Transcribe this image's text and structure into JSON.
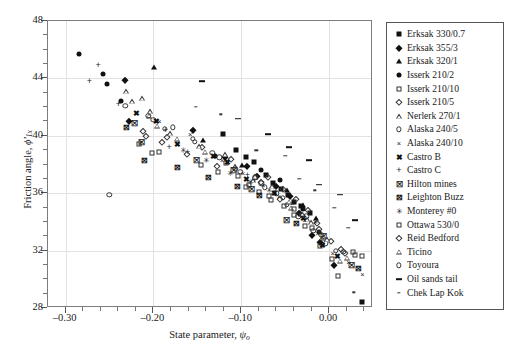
{
  "figure": {
    "title": "",
    "y_axis_label_prefix": "Friction angle, ",
    "y_axis_label_symbol": "ϕ'",
    "y_axis_label_sub": "1x",
    "x_axis_label_prefix": "State parameter, ",
    "x_axis_label_symbol": "ψ",
    "x_axis_label_sub": "o"
  },
  "chart_data": {
    "type": "scatter",
    "title": "",
    "xlabel": "State parameter, ψo",
    "ylabel": "Friction angle, ϕ'1x",
    "xlim": [
      -0.32,
      0.05
    ],
    "ylim": [
      28,
      48
    ],
    "xticks": [
      -0.3,
      -0.2,
      -0.1,
      0.0
    ],
    "xtick_labels": [
      "–0.30",
      "–0.20",
      "–0.10",
      "0.00"
    ],
    "xticks_minor": [
      -0.28,
      -0.26,
      -0.24,
      -0.22,
      -0.18,
      -0.16,
      -0.14,
      -0.12,
      -0.08,
      -0.06,
      -0.04,
      -0.02,
      0.02,
      0.04
    ],
    "yticks": [
      28,
      32,
      36,
      40,
      44,
      48
    ],
    "ytick_labels": [
      "28",
      "32",
      "36",
      "40",
      "44",
      "48"
    ],
    "yticks_minor": [
      29,
      30,
      31,
      33,
      34,
      35,
      37,
      38,
      39,
      41,
      42,
      43,
      45,
      46,
      47
    ],
    "grid": true,
    "grid_color": "#e2e2e2",
    "legend_position": "right-outside",
    "series": [
      {
        "name": "Erksak 330/0.7",
        "marker": "square-filled",
        "points": [
          [
            -0.121,
            40.1
          ],
          [
            -0.106,
            39.0
          ],
          [
            -0.095,
            38.5
          ],
          [
            -0.086,
            38.2
          ],
          [
            -0.072,
            37.3
          ],
          [
            -0.064,
            36.7
          ],
          [
            -0.055,
            36.3
          ],
          [
            -0.047,
            35.9
          ],
          [
            -0.04,
            35.4
          ],
          [
            -0.032,
            35.1
          ],
          [
            -0.022,
            34.6
          ],
          [
            0.038,
            28.4
          ]
        ]
      },
      {
        "name": "Erksak 355/3",
        "marker": "diamond-filled",
        "points": [
          [
            -0.232,
            43.9
          ],
          [
            -0.228,
            41.0
          ],
          [
            -0.155,
            40.4
          ],
          [
            -0.118,
            38.5
          ],
          [
            -0.093,
            37.9
          ],
          [
            -0.082,
            37.2
          ],
          [
            -0.06,
            36.5
          ],
          [
            -0.044,
            35.8
          ],
          [
            -0.034,
            34.6
          ],
          [
            -0.02,
            33.1
          ],
          [
            -0.01,
            32.6
          ],
          [
            0.006,
            31.0
          ]
        ]
      },
      {
        "name": "Erksak 320/1",
        "marker": "triangle-filled",
        "points": [
          [
            -0.199,
            44.8
          ],
          [
            -0.144,
            39.7
          ],
          [
            -0.099,
            38.0
          ],
          [
            -0.048,
            36.2
          ],
          [
            -0.03,
            35.2
          ],
          [
            -0.015,
            34.3
          ]
        ]
      },
      {
        "name": "Isserk 210/2",
        "marker": "circle-filled",
        "points": [
          [
            -0.285,
            45.7
          ],
          [
            -0.257,
            44.3
          ],
          [
            -0.253,
            43.6
          ],
          [
            -0.237,
            42.4
          ],
          [
            -0.13,
            38.6
          ],
          [
            -0.078,
            37.6
          ],
          [
            -0.056,
            36.9
          ],
          [
            -0.03,
            34.9
          ],
          [
            -0.011,
            33.3
          ]
        ]
      },
      {
        "name": "Isserk 210/10",
        "marker": "square-open",
        "points": [
          [
            -0.216,
            39.4
          ],
          [
            -0.202,
            38.8
          ],
          [
            -0.117,
            38.1
          ],
          [
            -0.104,
            37.2
          ],
          [
            -0.091,
            36.6
          ],
          [
            -0.08,
            36.1
          ],
          [
            -0.066,
            35.5
          ],
          [
            -0.051,
            35.1
          ],
          [
            -0.04,
            34.5
          ],
          [
            -0.027,
            33.7
          ],
          [
            -0.01,
            32.3
          ],
          [
            0.01,
            30.2
          ],
          [
            0.03,
            31.7
          ],
          [
            0.038,
            31.6
          ]
        ]
      },
      {
        "name": "Isserk 210/5",
        "marker": "diamond-open",
        "points": [
          [
            -0.212,
            40.3
          ],
          [
            -0.185,
            39.9
          ],
          [
            -0.145,
            39.2
          ],
          [
            -0.112,
            38.4
          ],
          [
            -0.07,
            37.1
          ],
          [
            -0.052,
            36.3
          ],
          [
            -0.038,
            35.6
          ],
          [
            -0.024,
            34.8
          ],
          [
            -0.014,
            33.9
          ],
          [
            0.002,
            32.7
          ],
          [
            0.014,
            32.1
          ]
        ]
      },
      {
        "name": "Nerlerk 270/1",
        "marker": "triangle-open",
        "points": [
          [
            -0.231,
            43.1
          ],
          [
            -0.213,
            42.6
          ],
          [
            -0.205,
            41.4
          ],
          [
            -0.196,
            40.7
          ],
          [
            -0.173,
            39.8
          ],
          [
            -0.141,
            38.9
          ],
          [
            -0.107,
            37.9
          ],
          [
            -0.087,
            36.9
          ],
          [
            -0.063,
            36.1
          ],
          [
            -0.043,
            35.0
          ],
          [
            -0.025,
            34.2
          ],
          [
            -0.008,
            32.9
          ],
          [
            0.012,
            31.3
          ]
        ]
      },
      {
        "name": "Alaska 240/5",
        "marker": "circle-open",
        "points": [
          [
            -0.232,
            42.1
          ],
          [
            -0.2,
            41.1
          ],
          [
            -0.187,
            40.5
          ],
          [
            -0.153,
            39.6
          ],
          [
            -0.125,
            38.5
          ],
          [
            -0.101,
            37.5
          ],
          [
            -0.084,
            37.1
          ],
          [
            -0.073,
            36.4
          ],
          [
            -0.06,
            36.0
          ],
          [
            -0.048,
            35.2
          ],
          [
            -0.035,
            34.4
          ],
          [
            -0.018,
            33.4
          ],
          [
            -0.004,
            32.5
          ],
          [
            0.016,
            31.9
          ],
          [
            -0.25,
            35.9
          ]
        ]
      },
      {
        "name": "Alaska 240/10",
        "marker": "x",
        "points": [
          [
            -0.193,
            41.0
          ],
          [
            -0.158,
            40.1
          ],
          [
            -0.122,
            38.3
          ],
          [
            -0.098,
            37.4
          ],
          [
            -0.075,
            36.6
          ],
          [
            -0.057,
            35.8
          ],
          [
            -0.042,
            35.3
          ],
          [
            -0.028,
            34.1
          ],
          [
            -0.013,
            33.2
          ],
          [
            0.004,
            31.8
          ],
          [
            0.022,
            31.2
          ],
          [
            0.038,
            30.4
          ]
        ]
      },
      {
        "name": "Castro B",
        "marker": "x-bold",
        "points": [
          [
            -0.219,
            41.6
          ],
          [
            -0.196,
            41.0
          ],
          [
            -0.173,
            39.4
          ],
          [
            -0.132,
            38.6
          ],
          [
            -0.116,
            38.2
          ],
          [
            -0.094,
            37.0
          ],
          [
            -0.062,
            36.0
          ],
          [
            -0.029,
            34.3
          ],
          [
            -0.007,
            32.4
          ],
          [
            0.01,
            31.6
          ]
        ]
      },
      {
        "name": "Castro C",
        "marker": "plus",
        "points": [
          [
            -0.263,
            44.9
          ],
          [
            -0.273,
            43.8
          ],
          [
            -0.24,
            42.2
          ],
          [
            -0.186,
            40.4
          ],
          [
            -0.182,
            39.2
          ],
          [
            -0.161,
            38.9
          ],
          [
            -0.093,
            37.3
          ],
          [
            -0.085,
            36.9
          ]
        ]
      },
      {
        "name": "Hilton mines",
        "marker": "x-box",
        "points": [
          [
            -0.221,
            40.9
          ],
          [
            -0.214,
            39.6
          ],
          [
            -0.151,
            38.3
          ],
          [
            -0.109,
            37.6
          ],
          [
            -0.088,
            36.3
          ],
          [
            -0.048,
            34.1
          ],
          [
            -0.006,
            33.0
          ],
          [
            0.026,
            31.0
          ]
        ]
      },
      {
        "name": "Leighton Buzz",
        "marker": "square-x",
        "points": [
          [
            -0.231,
            40.6
          ],
          [
            -0.21,
            38.3
          ],
          [
            -0.173,
            37.8
          ],
          [
            -0.137,
            37.1
          ],
          [
            -0.104,
            36.5
          ],
          [
            -0.079,
            35.9
          ],
          [
            -0.037,
            33.9
          ],
          [
            0.034,
            30.8
          ]
        ]
      },
      {
        "name": "Monterey #0",
        "marker": "star",
        "points": [
          [
            -0.166,
            39.0
          ],
          [
            -0.14,
            38.3
          ],
          [
            -0.112,
            37.4
          ],
          [
            -0.09,
            36.8
          ],
          [
            -0.068,
            36.2
          ],
          [
            -0.032,
            34.7
          ],
          [
            -0.016,
            34.0
          ]
        ]
      },
      {
        "name": "Ottawa 530/0",
        "marker": "square-open-sm",
        "points": [
          [
            -0.194,
            38.9
          ],
          [
            -0.146,
            38.0
          ],
          [
            -0.126,
            37.5
          ],
          [
            -0.095,
            36.4
          ],
          [
            -0.068,
            35.8
          ],
          [
            -0.04,
            34.9
          ],
          [
            -0.019,
            33.6
          ],
          [
            0.003,
            31.4
          ],
          [
            0.027,
            31.9
          ]
        ]
      },
      {
        "name": "Reid Bedford",
        "marker": "diamond-open-sm",
        "points": [
          [
            -0.208,
            40.0
          ],
          [
            -0.19,
            39.6
          ],
          [
            -0.162,
            38.7
          ],
          [
            -0.128,
            37.9
          ],
          [
            -0.078,
            36.8
          ],
          [
            -0.056,
            35.6
          ],
          [
            -0.031,
            34.5
          ],
          [
            -0.012,
            33.5
          ],
          [
            0.018,
            31.8
          ]
        ]
      },
      {
        "name": "Ticino",
        "marker": "triangle-open-sm",
        "points": [
          [
            -0.224,
            42.4
          ],
          [
            -0.204,
            41.7
          ],
          [
            -0.181,
            40.2
          ],
          [
            -0.148,
            39.3
          ],
          [
            -0.118,
            38.7
          ],
          [
            -0.084,
            37.2
          ],
          [
            -0.065,
            36.5
          ],
          [
            -0.046,
            35.4
          ],
          [
            -0.021,
            34.0
          ],
          [
            -0.002,
            32.8
          ],
          [
            0.02,
            31.5
          ]
        ]
      },
      {
        "name": "Toyoura",
        "marker": "circle-open-sm",
        "points": [
          [
            -0.206,
            41.4
          ],
          [
            -0.178,
            40.6
          ],
          [
            -0.155,
            39.8
          ],
          [
            -0.133,
            38.8
          ],
          [
            -0.106,
            37.7
          ],
          [
            -0.077,
            36.7
          ],
          [
            -0.053,
            35.7
          ],
          [
            -0.026,
            34.4
          ],
          [
            -0.009,
            33.1
          ],
          [
            0.008,
            32.0
          ]
        ]
      },
      {
        "name": "Oil sands tail",
        "marker": "dash-long",
        "points": [
          [
            -0.145,
            43.8
          ],
          [
            -0.104,
            41.2
          ],
          [
            -0.07,
            40.1
          ],
          [
            -0.046,
            39.2
          ],
          [
            -0.023,
            38.3
          ],
          [
            -0.011,
            36.6
          ],
          [
            0.012,
            35.9
          ],
          [
            0.03,
            34.1
          ]
        ]
      },
      {
        "name": "Chek Lap Kok",
        "marker": "dash-short",
        "points": [
          [
            -0.152,
            42.0
          ],
          [
            -0.123,
            41.5
          ],
          [
            -0.083,
            39.0
          ],
          [
            -0.05,
            38.6
          ],
          [
            -0.034,
            37.0
          ],
          [
            -0.016,
            36.2
          ],
          [
            0.006,
            35.0
          ],
          [
            0.022,
            33.6
          ],
          [
            0.028,
            29.1
          ]
        ]
      }
    ]
  },
  "legend": {
    "items": [
      {
        "label": "Erksak 330/0.7",
        "marker": "square-filled"
      },
      {
        "label": "Erksak 355/3",
        "marker": "diamond-filled"
      },
      {
        "label": "Erksak 320/1",
        "marker": "triangle-filled"
      },
      {
        "label": "Isserk 210/2",
        "marker": "circle-filled"
      },
      {
        "label": "Isserk 210/10",
        "marker": "square-open"
      },
      {
        "label": "Isserk 210/5",
        "marker": "diamond-open"
      },
      {
        "label": "Nerlerk 270/1",
        "marker": "triangle-open"
      },
      {
        "label": "Alaska 240/5",
        "marker": "circle-open"
      },
      {
        "label": "Alaska 240/10",
        "marker": "x"
      },
      {
        "label": "Castro B",
        "marker": "x-bold"
      },
      {
        "label": "Castro C",
        "marker": "plus"
      },
      {
        "label": "Hilton mines",
        "marker": "x-box"
      },
      {
        "label": "Leighton Buzz",
        "marker": "square-x"
      },
      {
        "label": "Monterey #0",
        "marker": "star"
      },
      {
        "label": "Ottawa 530/0",
        "marker": "square-open-sm"
      },
      {
        "label": "Reid Bedford",
        "marker": "diamond-open-sm"
      },
      {
        "label": "Ticino",
        "marker": "triangle-open-sm"
      },
      {
        "label": "Toyoura",
        "marker": "circle-open-sm"
      },
      {
        "label": "Oil sands tail",
        "marker": "dash-long"
      },
      {
        "label": "Chek Lap Kok",
        "marker": "dash-short"
      }
    ]
  }
}
